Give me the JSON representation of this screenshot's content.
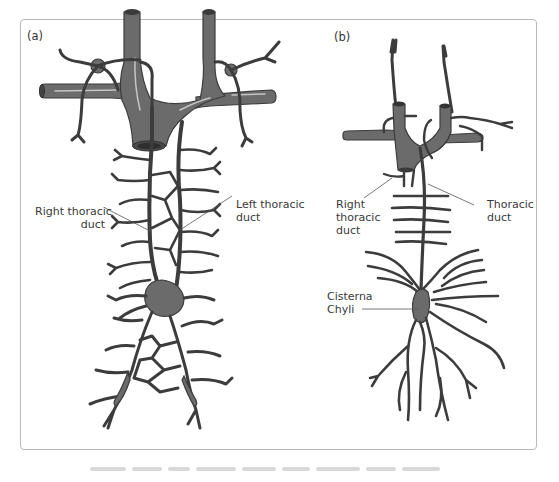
{
  "figure": {
    "panels": [
      {
        "id": "a",
        "label": "(a)",
        "annotations": [
          {
            "line1": "Right thoracic",
            "line2": "duct"
          },
          {
            "line1": "Left thoracic",
            "line2": "duct"
          }
        ]
      },
      {
        "id": "b",
        "label": "(b)",
        "annotations": [
          {
            "line1": "Right",
            "line2": "thoracic",
            "line3": "duct"
          },
          {
            "line1": "Thoracic",
            "line2": "duct"
          },
          {
            "line1": "Cisterna",
            "line2": "Chyli"
          }
        ]
      }
    ],
    "colors": {
      "vessel_fill": "#6b6b6b",
      "vessel_stroke": "#3c3c3c",
      "vessel_highlight": "#bdbdbd",
      "frame_border": "#b9b9b9",
      "label_text": "#3a3a3a",
      "leader_line": "#555555"
    }
  }
}
